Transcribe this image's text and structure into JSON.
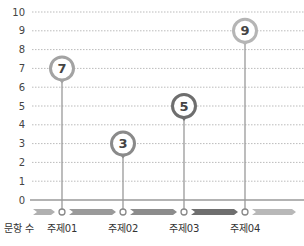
{
  "chart_data": {
    "type": "lollipop",
    "title": "",
    "xlabel": "",
    "ylabel": "",
    "row_label": "문항 수",
    "categories": [
      "주제01",
      "주제02",
      "주제03",
      "주제04"
    ],
    "values": [
      7,
      3,
      5,
      9
    ],
    "ylim": [
      0,
      10
    ],
    "yticks": [
      0,
      1,
      2,
      3,
      4,
      5,
      6,
      7,
      8,
      9,
      10
    ],
    "grid": true,
    "grid_style": "dotted",
    "legend": null
  },
  "colors": {
    "grid": "#bbbbbb",
    "axis": "#999999",
    "stem": "#999999",
    "marker_ring": [
      "#a3a3a3",
      "#8a8a8a",
      "#6e6e6e",
      "#b5b5b5"
    ],
    "value_text": "#444444",
    "band_segments": [
      "#b0b0b0",
      "#9a9a9a",
      "#8c8c8c",
      "#6f6f6f",
      "#b8b8b8"
    ]
  }
}
